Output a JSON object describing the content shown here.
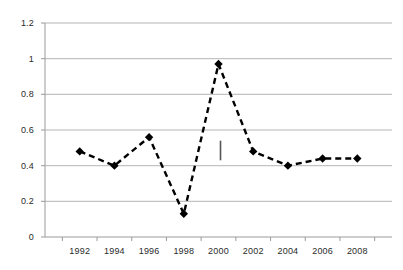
{
  "chart_data": {
    "type": "line",
    "title": "",
    "subtitle": "",
    "xlabel": "",
    "ylabel": "",
    "x": [
      1992,
      1993,
      1994,
      1995,
      1996,
      1997,
      1998,
      1999,
      2000,
      2001,
      2002,
      2003,
      2004,
      2005,
      2006,
      2007,
      2008
    ],
    "categories": [
      "1992",
      "1994",
      "1996",
      "1998",
      "2000",
      "2002",
      "2004",
      "2006",
      "2008"
    ],
    "values": [
      0.48,
      0.4,
      0.56,
      0.13,
      0.97,
      0.48,
      0.4,
      0.44,
      0.44
    ],
    "series": [
      {
        "name": "series-1",
        "points": [
          {
            "x": "1992",
            "y": 0.48
          },
          {
            "x": "1994",
            "y": 0.4
          },
          {
            "x": "1996",
            "y": 0.56
          },
          {
            "x": "1998",
            "y": 0.13
          },
          {
            "x": "2000",
            "y": 0.97
          },
          {
            "x": "2002",
            "y": 0.48
          },
          {
            "x": "2004",
            "y": 0.4
          },
          {
            "x": "2006",
            "y": 0.44
          },
          {
            "x": "2008",
            "y": 0.44
          }
        ],
        "line_style": "dashed",
        "line_color": "#000000",
        "marker": "diamond",
        "marker_color": "#000000"
      }
    ],
    "ylim": [
      0,
      1.2
    ],
    "yticks": [
      0,
      0.2,
      0.4,
      0.6,
      0.8,
      1,
      1.2
    ],
    "ytick_labels": [
      "0",
      "0.2",
      "0.4",
      "0.6",
      "0.8",
      "1",
      "1.2"
    ],
    "xtick_labels": [
      "1992",
      "1994",
      "1996",
      "1998",
      "2000",
      "2002",
      "2004",
      "2006",
      "2008"
    ],
    "grid": "horizontal",
    "grid_color": "#b3b3b3",
    "axis_color": "#9a9a9a",
    "legend": "none",
    "annotations": [
      {
        "name": "vertical-tick-mark",
        "x": "2000",
        "y_from": 0.43,
        "y_to": 0.54
      }
    ],
    "background_color": "#ffffff"
  }
}
